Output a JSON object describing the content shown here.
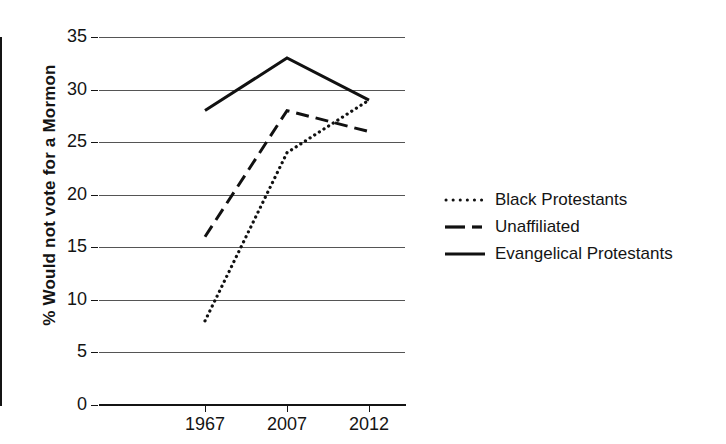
{
  "chart_data": {
    "type": "line",
    "title": "",
    "xlabel": "",
    "ylabel": "% Would not vote for a Mormon",
    "categories": [
      "1967",
      "2007",
      "2012"
    ],
    "ylim": [
      0,
      35
    ],
    "ytick_step": 5,
    "yticks": [
      "35",
      "30",
      "25",
      "20",
      "15",
      "10",
      "5",
      "0"
    ],
    "grid": "horizontal",
    "legend_position": "right",
    "series": [
      {
        "name": "Black Protestants",
        "style": "dotted",
        "color": "#111111",
        "values": [
          8,
          24,
          29
        ]
      },
      {
        "name": "Unaffiliated",
        "style": "dashed",
        "color": "#111111",
        "values": [
          16,
          28,
          26
        ]
      },
      {
        "name": "Evangelical Protestants",
        "style": "solid",
        "color": "#111111",
        "values": [
          28,
          33,
          29
        ]
      }
    ]
  }
}
